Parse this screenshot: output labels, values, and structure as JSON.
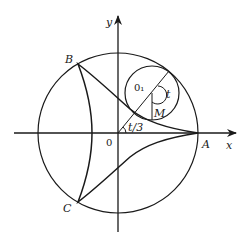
{
  "diagram": {
    "type": "geometry-figure",
    "axes": {
      "x_label": "x",
      "y_label": "y",
      "origin_label": "0"
    },
    "points": {
      "A": "A",
      "B": "B",
      "C": "C",
      "O1": "0₁",
      "M": "M"
    },
    "angles": {
      "rolling_angle": "t",
      "center_angle": "t/3"
    },
    "colors": {
      "stroke": "#1a1a1a",
      "background": "#ffffff"
    }
  }
}
